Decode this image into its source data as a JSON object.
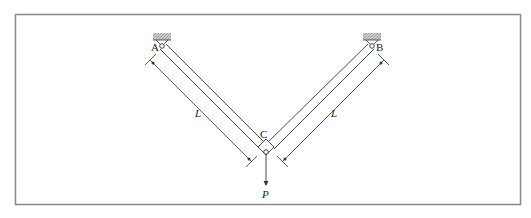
{
  "diagram": {
    "nodes": [
      {
        "id": "A",
        "label": "A",
        "type": "pin-support"
      },
      {
        "id": "B",
        "label": "B",
        "type": "pin-support"
      },
      {
        "id": "C",
        "label": "C",
        "type": "pin-joint"
      }
    ],
    "members": [
      {
        "from": "A",
        "to": "C",
        "length_label": "L"
      },
      {
        "from": "B",
        "to": "C",
        "length_label": "L"
      }
    ],
    "load": {
      "at": "C",
      "label": "P",
      "direction": "down"
    },
    "colors": {
      "line": "#333333",
      "border": "#777777",
      "hatch": "#999999"
    }
  }
}
